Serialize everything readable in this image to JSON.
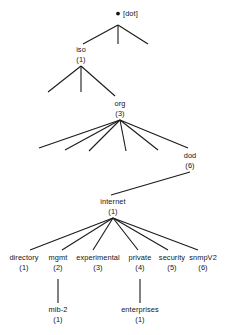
{
  "diagram": {
    "type": "object-identifier-tree",
    "title": "",
    "background_color": "#ffffff",
    "line_color": "#1a1a1a",
    "text_color": "#141414",
    "root": {
      "id": "root",
      "label": "[dot]",
      "bullet": "•",
      "index": "",
      "x": 118,
      "y": 16,
      "anchor_x": 118,
      "anchor_y": 24
    },
    "nodes": [
      {
        "id": "iso",
        "label": "iso",
        "index": "(1)",
        "x": 81,
        "label_y": 52,
        "index_y": 62,
        "top_y": 45,
        "bottom_y": 65
      },
      {
        "id": "org",
        "label": "org",
        "index": "(3)",
        "x": 120,
        "label_y": 106,
        "index_y": 116,
        "top_y": 99,
        "bottom_y": 119
      },
      {
        "id": "dod",
        "label": "dod",
        "index": "(6)",
        "x": 190,
        "label_y": 158,
        "index_y": 168,
        "top_y": 151,
        "bottom_y": 171
      },
      {
        "id": "internet",
        "label": "internet",
        "index": "(1)",
        "x": 113,
        "label_y": 204,
        "index_y": 214,
        "top_y": 197,
        "bottom_y": 217
      },
      {
        "id": "directory",
        "label": "directory",
        "index": "(1)",
        "x": 24,
        "label_y": 260,
        "index_y": 270,
        "top_y": 253,
        "bottom_y": 273
      },
      {
        "id": "mgmt",
        "label": "mgmt",
        "index": "(2)",
        "x": 58,
        "label_y": 260,
        "index_y": 270,
        "top_y": 253,
        "bottom_y": 273
      },
      {
        "id": "experimental",
        "label": "experimental",
        "index": "(3)",
        "x": 98,
        "label_y": 260,
        "index_y": 270,
        "top_y": 253,
        "bottom_y": 273
      },
      {
        "id": "private",
        "label": "private",
        "index": "(4)",
        "x": 140,
        "label_y": 260,
        "index_y": 270,
        "top_y": 253,
        "bottom_y": 273
      },
      {
        "id": "security",
        "label": "security",
        "index": "(5)",
        "x": 172,
        "label_y": 260,
        "index_y": 270,
        "top_y": 253,
        "bottom_y": 273
      },
      {
        "id": "snmpV2",
        "label": "snmpV2",
        "index": "(6)",
        "x": 203,
        "label_y": 260,
        "index_y": 270,
        "top_y": 253,
        "bottom_y": 273
      },
      {
        "id": "mib-2",
        "label": "mib-2",
        "index": "(1)",
        "x": 58,
        "label_y": 312,
        "index_y": 322,
        "top_y": 305,
        "bottom_y": 325
      },
      {
        "id": "enterprises",
        "label": "enterprises",
        "index": "(1)",
        "x": 140,
        "label_y": 312,
        "index_y": 322,
        "top_y": 305,
        "bottom_y": 325
      }
    ],
    "edges": [
      {
        "from": "root",
        "to": "unlabeled-left-1",
        "x1": 118,
        "y1": 25,
        "x2": 83,
        "y2": 44
      },
      {
        "from": "root",
        "to": "unlabeled-mid-1",
        "x1": 118,
        "y1": 25,
        "x2": 118,
        "y2": 44
      },
      {
        "from": "root",
        "to": "unlabeled-right-1",
        "x1": 118,
        "y1": 25,
        "x2": 148,
        "y2": 44
      },
      {
        "from": "iso",
        "to": "unlabeled-left-2",
        "x1": 81,
        "y1": 66,
        "x2": 48,
        "y2": 92
      },
      {
        "from": "iso",
        "to": "unlabeled-mid-2",
        "x1": 81,
        "y1": 66,
        "x2": 81,
        "y2": 92
      },
      {
        "from": "iso",
        "to": "org",
        "x1": 81,
        "y1": 66,
        "x2": 115,
        "y2": 96
      },
      {
        "from": "org",
        "to": "unlabeled-a",
        "x1": 120,
        "y1": 120,
        "x2": 39,
        "y2": 148
      },
      {
        "from": "org",
        "to": "unlabeled-b",
        "x1": 120,
        "y1": 120,
        "x2": 65,
        "y2": 150
      },
      {
        "from": "org",
        "to": "unlabeled-c",
        "x1": 120,
        "y1": 120,
        "x2": 89,
        "y2": 151
      },
      {
        "from": "org",
        "to": "unlabeled-d",
        "x1": 120,
        "y1": 120,
        "x2": 126,
        "y2": 151
      },
      {
        "from": "org",
        "to": "unlabeled-e",
        "x1": 120,
        "y1": 120,
        "x2": 158,
        "y2": 150
      },
      {
        "from": "org",
        "to": "dod",
        "x1": 120,
        "y1": 120,
        "x2": 188,
        "y2": 148
      },
      {
        "from": "dod",
        "to": "internet",
        "x1": 190,
        "y1": 172,
        "x2": 111,
        "y2": 195
      },
      {
        "from": "internet",
        "to": "directory",
        "x1": 113,
        "y1": 218,
        "x2": 30,
        "y2": 250
      },
      {
        "from": "internet",
        "to": "mgmt",
        "x1": 113,
        "y1": 218,
        "x2": 62,
        "y2": 250
      },
      {
        "from": "internet",
        "to": "experimental",
        "x1": 113,
        "y1": 218,
        "x2": 93,
        "y2": 250
      },
      {
        "from": "internet",
        "to": "private",
        "x1": 113,
        "y1": 218,
        "x2": 138,
        "y2": 250
      },
      {
        "from": "internet",
        "to": "security",
        "x1": 113,
        "y1": 218,
        "x2": 168,
        "y2": 250
      },
      {
        "from": "internet",
        "to": "snmpV2",
        "x1": 113,
        "y1": 218,
        "x2": 198,
        "y2": 250
      },
      {
        "from": "mgmt",
        "to": "mib-2",
        "x1": 58,
        "y1": 279,
        "x2": 58,
        "y2": 303
      },
      {
        "from": "private",
        "to": "enterprises",
        "x1": 140,
        "y1": 279,
        "x2": 140,
        "y2": 303
      }
    ]
  }
}
